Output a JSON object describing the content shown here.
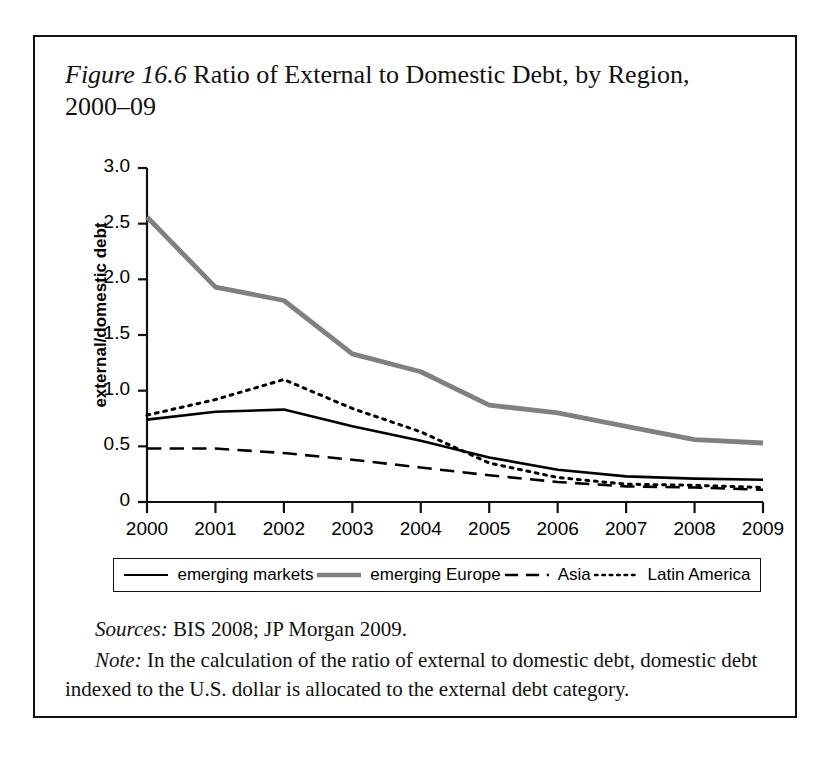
{
  "figure": {
    "label": "Figure 16.6",
    "caption": " Ratio of External to Domestic Debt, by Region, 2000–09",
    "sources_lead": "Sources:",
    "sources_text": " BIS 2008; JP Morgan 2009.",
    "note_lead": "Note:",
    "note_text": " In the calculation of the ratio of external to domestic debt, domestic debt indexed to the U.S. dollar is allocated to the external debt category."
  },
  "colors": {
    "emerging_markets": "#000000",
    "emerging_europe": "#808080",
    "asia": "#000000",
    "latin_america": "#000000",
    "axis": "#111111",
    "frame": "#111111",
    "background": "#ffffff"
  },
  "legend": {
    "items": [
      {
        "label": "emerging markets",
        "style": "solid",
        "color": "#000000",
        "width": 2.2
      },
      {
        "label": "emerging Europe",
        "style": "solid",
        "color": "#808080",
        "width": 4.6
      },
      {
        "label": "Asia",
        "style": "dashed",
        "color": "#000000",
        "width": 2.4
      },
      {
        "label": "Latin America",
        "style": "dotted",
        "color": "#000000",
        "width": 2.6
      }
    ]
  },
  "chart_data": {
    "type": "line",
    "title": "Ratio of External to Domestic Debt, by Region, 2000–09",
    "xlabel": "",
    "ylabel": "external/domestic debt",
    "x": [
      2000,
      2001,
      2002,
      2003,
      2004,
      2005,
      2006,
      2007,
      2008,
      2009
    ],
    "categories": [
      "2000",
      "2001",
      "2002",
      "2003",
      "2004",
      "2005",
      "2006",
      "2007",
      "2008",
      "2009"
    ],
    "ylim": [
      0,
      3.0
    ],
    "yticks": [
      0,
      0.5,
      1.0,
      1.5,
      2.0,
      2.5,
      3.0
    ],
    "ytick_labels": [
      "0",
      "0.5",
      "1.0",
      "1.5",
      "2.0",
      "2.5",
      "3.0"
    ],
    "grid": false,
    "legend_position": "below",
    "series": [
      {
        "name": "emerging markets",
        "style": "solid",
        "color": "#000000",
        "values": [
          0.74,
          0.81,
          0.83,
          0.68,
          0.55,
          0.4,
          0.29,
          0.23,
          0.21,
          0.2
        ]
      },
      {
        "name": "emerging Europe",
        "style": "solid",
        "color": "#808080",
        "values": [
          2.56,
          1.93,
          1.81,
          1.33,
          1.17,
          0.87,
          0.8,
          0.68,
          0.56,
          0.53
        ]
      },
      {
        "name": "Asia",
        "style": "dashed",
        "color": "#000000",
        "values": [
          0.48,
          0.48,
          0.44,
          0.38,
          0.31,
          0.24,
          0.18,
          0.14,
          0.13,
          0.11
        ]
      },
      {
        "name": "Latin America",
        "style": "dotted",
        "color": "#000000",
        "values": [
          0.78,
          0.92,
          1.1,
          0.84,
          0.63,
          0.35,
          0.22,
          0.16,
          0.15,
          0.13
        ]
      }
    ]
  }
}
